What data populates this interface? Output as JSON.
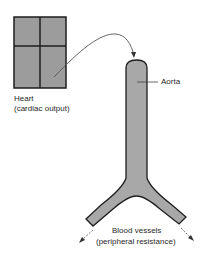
{
  "diagram": {
    "colors": {
      "fill": "#9c9c9c",
      "vessel_fill": "#a8a8a8",
      "stroke": "#1e1e1e",
      "arrow": "#555555"
    },
    "heart": {
      "label": "Heart",
      "sublabel": "(cardiac output)"
    },
    "aorta": {
      "label": "Aorta"
    },
    "vessels": {
      "label": "Blood vessels",
      "sublabel": "(peripheral resistance)"
    }
  }
}
